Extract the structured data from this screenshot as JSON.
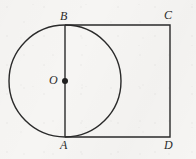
{
  "figure": {
    "name": "circle-inscribed-with-square-diagram",
    "background_color": "#f6f5f3",
    "stroke_color": "#2a2a2a",
    "labels": {
      "top_of_circle": "B",
      "top_right_corner": "C",
      "bottom_of_circle": "A",
      "bottom_right_corner": "D",
      "center": "O"
    },
    "shapes": {
      "circle": {
        "type": "circle",
        "center_x": 65,
        "center_y": 81,
        "radius": 56,
        "filled": false
      },
      "square": {
        "type": "rectangle",
        "left": 65,
        "top": 25,
        "right": 170,
        "bottom": 137
      },
      "diameter_segment": {
        "type": "line",
        "x1": 65,
        "y1": 25,
        "x2": 65,
        "y2": 137
      },
      "center_dot": {
        "type": "dot",
        "cx": 65,
        "cy": 81,
        "r": 3
      }
    }
  }
}
